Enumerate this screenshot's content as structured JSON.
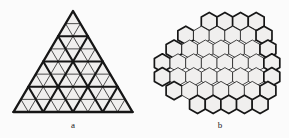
{
  "figure": {
    "background_color": "#fbfbfb",
    "stroke_color": "#161616",
    "fill_color": "#f0efee",
    "width": 289,
    "height": 138,
    "panels": [
      {
        "id": "panel-a",
        "label": "a",
        "label_x": 73,
        "label_y": 125,
        "type": "subdivided-triangle",
        "description": "Equilateral triangle subdivided into a triangular grid",
        "apex": {
          "x": 73,
          "y": 11
        },
        "base_left": {
          "x": 13.5,
          "y": 112
        },
        "base_right": {
          "x": 132.5,
          "y": 112
        },
        "fine_rows": 8,
        "coarse_rows": 4,
        "small_triangle_count": 64,
        "coarse_triangle_count": 16,
        "thin_stroke_width": 0.75,
        "thick_stroke_width": 2.1
      },
      {
        "id": "panel-b",
        "label": "b",
        "label_x": 220,
        "label_y": 125,
        "type": "hexagon-cluster",
        "description": "Cluster of flat-top hexagons in staggered rows with a rough hexagonal outline",
        "center": {
          "x": 221,
          "y": 63
        },
        "hex_radius": 9.2,
        "hex_orientation": "flat-top",
        "row_counts": [
          4,
          6,
          7,
          8,
          8,
          7,
          5
        ],
        "row_offsets": [
          1.5,
          0.5,
          0.0,
          -0.5,
          -0.5,
          0.0,
          1.0
        ],
        "hexagon_count": 45,
        "thin_stroke_width": 0.8,
        "thick_stroke_width": 1.7
      }
    ]
  }
}
